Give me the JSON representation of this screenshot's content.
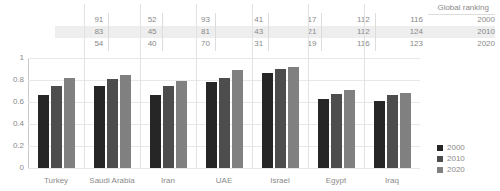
{
  "table": {
    "header": "Global ranking",
    "row_labels": [
      "2000",
      "2010",
      "2020"
    ],
    "countries": [
      "Turkey",
      "Saudi Arabia",
      "Iran",
      "UAE",
      "Israel",
      "Egypt",
      "Iraq"
    ],
    "rows": [
      [
        91,
        52,
        93,
        41,
        17,
        112,
        116
      ],
      [
        83,
        45,
        81,
        43,
        21,
        112,
        124
      ],
      [
        54,
        40,
        70,
        31,
        19,
        116,
        123
      ]
    ],
    "highlight_row_index": 1,
    "highlight_color": "#eeeeee"
  },
  "legend": {
    "position": "right",
    "items": [
      {
        "label": "2000",
        "color": "#262626"
      },
      {
        "label": "2010",
        "color": "#4d4d4d"
      },
      {
        "label": "2020",
        "color": "#808080"
      }
    ]
  },
  "chart_data": {
    "type": "bar",
    "title": "",
    "subtitle": "",
    "xlabel": "",
    "ylabel": "",
    "categories": [
      "Turkey",
      "Saudi Arabia",
      "Iran",
      "UAE",
      "Israel",
      "Egypt",
      "Iraq"
    ],
    "series": [
      {
        "name": "2000",
        "color": "#262626",
        "values": [
          0.66,
          0.75,
          0.66,
          0.78,
          0.86,
          0.63,
          0.61
        ]
      },
      {
        "name": "2010",
        "color": "#4d4d4d",
        "values": [
          0.75,
          0.81,
          0.75,
          0.82,
          0.9,
          0.67,
          0.66
        ]
      },
      {
        "name": "2020",
        "color": "#808080",
        "values": [
          0.82,
          0.85,
          0.79,
          0.89,
          0.92,
          0.71,
          0.68
        ]
      }
    ],
    "ylim": [
      0,
      1
    ],
    "yticks": [
      0,
      0.2,
      0.4,
      0.6,
      0.8,
      1
    ],
    "ytick_labels": [
      "0",
      "0.2",
      "0.4",
      "0.6",
      "0.8",
      "1"
    ],
    "grid": true,
    "legend_position": "right"
  }
}
